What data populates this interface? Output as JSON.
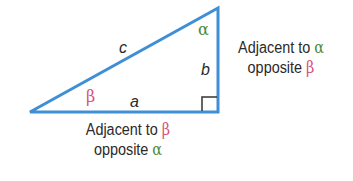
{
  "diagram": {
    "type": "right-triangle",
    "colors": {
      "triangle": "#3f8fd6",
      "alpha": "#4e8a3a",
      "beta": "#d6547a",
      "text": "#2a2a2a",
      "right_angle": "#333333"
    },
    "vertices": {
      "left": [
        30,
        112
      ],
      "right_bottom": [
        218,
        112
      ],
      "top": [
        218,
        8
      ]
    },
    "sides": {
      "hypotenuse": "c",
      "base": "a",
      "vertical": "b"
    },
    "angles": {
      "top": "α",
      "left": "β"
    },
    "captions": {
      "right": {
        "line1_text": "Adjacent to ",
        "line1_symbol": "α",
        "line2_text": "opposite ",
        "line2_symbol": "β"
      },
      "bottom": {
        "line1_text": "Adjacent to ",
        "line1_symbol": "β",
        "line2_text": "opposite ",
        "line2_symbol": "α"
      }
    }
  }
}
